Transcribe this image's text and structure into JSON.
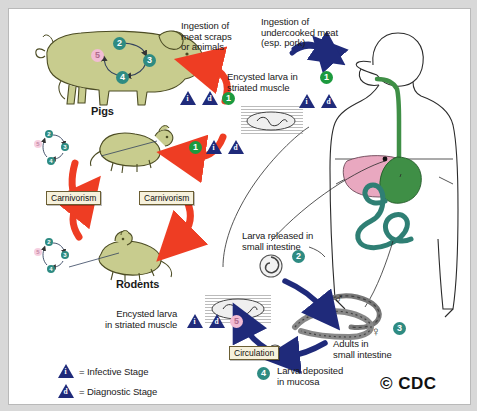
{
  "diagram": {
    "copyright": "© CDC",
    "colors": {
      "infective_triangle": "#1f2a7a",
      "diagnostic_triangle": "#1f2a7a",
      "stage_green": "#1c9a3e",
      "stage_teal": "#2e8b82",
      "stage_pink": "#f2bcd4",
      "red_arrow": "#ee3d23",
      "blue_arrow": "#1f2a7a",
      "animal_body": "#c8cc8e",
      "liver_pink": "#e9a8c0",
      "stomach_green": "#3f8f46",
      "intestine_teal": "#2f7f74",
      "label_box_fill": "#f6f1dc",
      "label_box_border": "#6b5e33",
      "frame_border": "#b9b9b9",
      "page_background": "#d8d8d8"
    }
  },
  "labels": {
    "pigs": "Pigs",
    "rodents": "Rodents",
    "ingestion_meat_scraps": "Ingestion of\nmeat scraps\nor animals",
    "ingestion_undercooked": "Ingestion of\nundercooked meat\n(esp. pork)",
    "encysted_larva_top": "Encysted larva in\nstriated muscle",
    "encysted_larva_bottom": "Encysted larva\nin striated muscle",
    "larva_released": "Larva released in\nsmall intestine",
    "adults_small_intestine": "Adults in\nsmall intestine",
    "larva_deposited": "Larva deposited\nin mucosa",
    "carnivorism_left": "Carnivorism",
    "carnivorism_right": "Carnivorism",
    "circulation": "Circulation"
  },
  "legend": {
    "infective": {
      "symbol": "i",
      "text": "= Infective Stage"
    },
    "diagnostic": {
      "symbol": "d",
      "text": "= Diagnostic Stage"
    }
  },
  "stage_badges": {
    "pig_cycle": [
      "2",
      "3",
      "4",
      "5"
    ],
    "rodent_cycle": [
      "2",
      "3",
      "4",
      "5"
    ],
    "pig_ingestion": "1",
    "rodent_ingestion": "1",
    "human_ingestion": "1",
    "larva_released": "2",
    "adults": "3",
    "larva_deposited": "4",
    "encysted_human": "5"
  },
  "symbols": {
    "male": "♂",
    "female": "♀",
    "infective_letter": "i",
    "diagnostic_letter": "d"
  }
}
